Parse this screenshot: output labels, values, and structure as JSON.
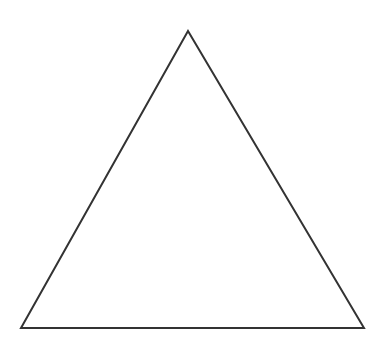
{
  "diagram": {
    "shape": "triangle",
    "kind": "equilateral-outline",
    "stroke_color": "#333333",
    "fill_color": "none",
    "background_color": "#ffffff",
    "stroke_width": 2,
    "vertices": {
      "apex": [
        188,
        31
      ],
      "bottom_left": [
        21,
        328
      ],
      "bottom_right": [
        364,
        328
      ]
    }
  }
}
